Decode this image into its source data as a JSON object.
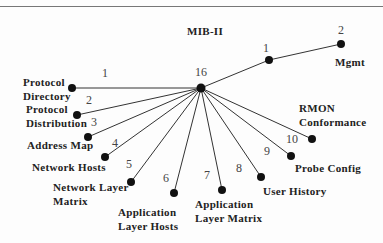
{
  "diagram": {
    "title": "MIB-II",
    "center": {
      "label": "16",
      "x": 201,
      "y": 88
    },
    "mgmt_branch": [
      {
        "num": "1",
        "x": 269,
        "y": 60,
        "num_x": 263,
        "num_y": 52
      },
      {
        "num": "2",
        "x": 341,
        "y": 44,
        "num_x": 338,
        "num_y": 34,
        "label": "Mgmt",
        "label_x": 335,
        "label_y": 66
      }
    ],
    "nodes": [
      {
        "num": "1",
        "num_x": 102,
        "num_y": 77,
        "x": 72,
        "y": 88,
        "label": [
          "Protocol",
          "Directory"
        ],
        "lx": 23,
        "ly": [
          86,
          100
        ]
      },
      {
        "num": "2",
        "num_x": 86,
        "num_y": 104,
        "x": 77,
        "y": 115,
        "label": [
          "Protocol",
          "Distribution"
        ],
        "lx": 26,
        "ly": [
          113,
          127
        ]
      },
      {
        "num": "3",
        "num_x": 91,
        "num_y": 126,
        "x": 88,
        "y": 137,
        "label": [
          "Address Map"
        ],
        "lx": 27,
        "ly": [
          149
        ]
      },
      {
        "num": "4",
        "num_x": 112,
        "num_y": 147,
        "x": 105,
        "y": 157,
        "label": [
          "Network Hosts"
        ],
        "lx": 32,
        "ly": [
          171
        ]
      },
      {
        "num": "5",
        "num_x": 126,
        "num_y": 168,
        "x": 131,
        "y": 182,
        "label": [
          "Network Layer",
          "Matrix"
        ],
        "lx": 53,
        "ly": [
          191,
          205
        ]
      },
      {
        "num": "6",
        "num_x": 163,
        "num_y": 182,
        "x": 174,
        "y": 193,
        "label": [
          "Application",
          "Layer Hosts"
        ],
        "lx": 118,
        "ly": [
          216,
          230
        ]
      },
      {
        "num": "7",
        "num_x": 204,
        "num_y": 179,
        "x": 222,
        "y": 190,
        "label": [
          "Application",
          "Layer Matrix"
        ],
        "lx": 195,
        "ly": [
          208,
          222
        ]
      },
      {
        "num": "8",
        "num_x": 236,
        "num_y": 172,
        "x": 261,
        "y": 177,
        "label": [
          "User History"
        ],
        "lx": 263,
        "ly": [
          195
        ]
      },
      {
        "num": "9",
        "num_x": 264,
        "num_y": 155,
        "x": 291,
        "y": 156,
        "label": [
          "Probe Config"
        ],
        "lx": 295,
        "ly": [
          172
        ]
      },
      {
        "num": "10",
        "num_x": 286,
        "num_y": 143,
        "x": 312,
        "y": 139,
        "label": [
          "RMON",
          "Conformance"
        ],
        "lx": 299,
        "ly": [
          112,
          126
        ]
      }
    ]
  }
}
